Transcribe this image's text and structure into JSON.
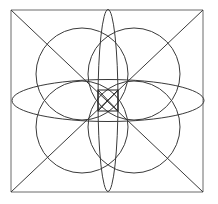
{
  "figure": {
    "canvas": {
      "width": 218,
      "height": 204,
      "background_color": "#ffffff"
    },
    "style": {
      "stroke_color": "#3a3a3a",
      "outer_frame_color": "#6b6b6b",
      "stroke_width": 1,
      "fill": "none"
    },
    "square": {
      "name": "outer-square",
      "x": 11,
      "y": 10,
      "width": 192,
      "height": 182,
      "left": 11,
      "top": 10,
      "right": 203,
      "bottom": 192
    },
    "center": {
      "x": 108,
      "y": 100.5
    },
    "diagonals": [
      {
        "name": "diagonal-tl-br",
        "x1": 11,
        "y1": 10,
        "x2": 203,
        "y2": 192
      },
      {
        "name": "diagonal-tr-bl",
        "x1": 203,
        "y1": 10,
        "x2": 11,
        "y2": 192
      }
    ],
    "circles": [
      {
        "name": "petal-circle-top-left",
        "cx": 82,
        "cy": 74,
        "r": 46
      },
      {
        "name": "petal-circle-top-right",
        "cx": 134,
        "cy": 74,
        "r": 46
      },
      {
        "name": "petal-circle-bottom-left",
        "cx": 82,
        "cy": 127,
        "r": 46
      },
      {
        "name": "petal-circle-bottom-right",
        "cx": 134,
        "cy": 127,
        "r": 46
      }
    ],
    "ellipses": [
      {
        "name": "horizontal-ellipse",
        "cx": 108,
        "cy": 100.5,
        "rx": 96,
        "ry": 21
      },
      {
        "name": "vertical-ellipse",
        "cx": 108,
        "cy": 100.5,
        "rx": 10,
        "ry": 91
      }
    ],
    "inner_square": {
      "name": "center-square",
      "x": 98,
      "y": 90,
      "width": 20,
      "height": 21,
      "left": 98,
      "top": 90,
      "right": 118,
      "bottom": 111
    },
    "inner_square_diagonals": [
      {
        "name": "inner-diagonal-tl-br",
        "x1": 98,
        "y1": 90,
        "x2": 118,
        "y2": 111
      },
      {
        "name": "inner-diagonal-tr-bl",
        "x1": 118,
        "y1": 90,
        "x2": 98,
        "y2": 111
      }
    ],
    "counts": {
      "circles": 4,
      "ellipses": 2,
      "diagonals": 2,
      "squares": 2
    }
  }
}
